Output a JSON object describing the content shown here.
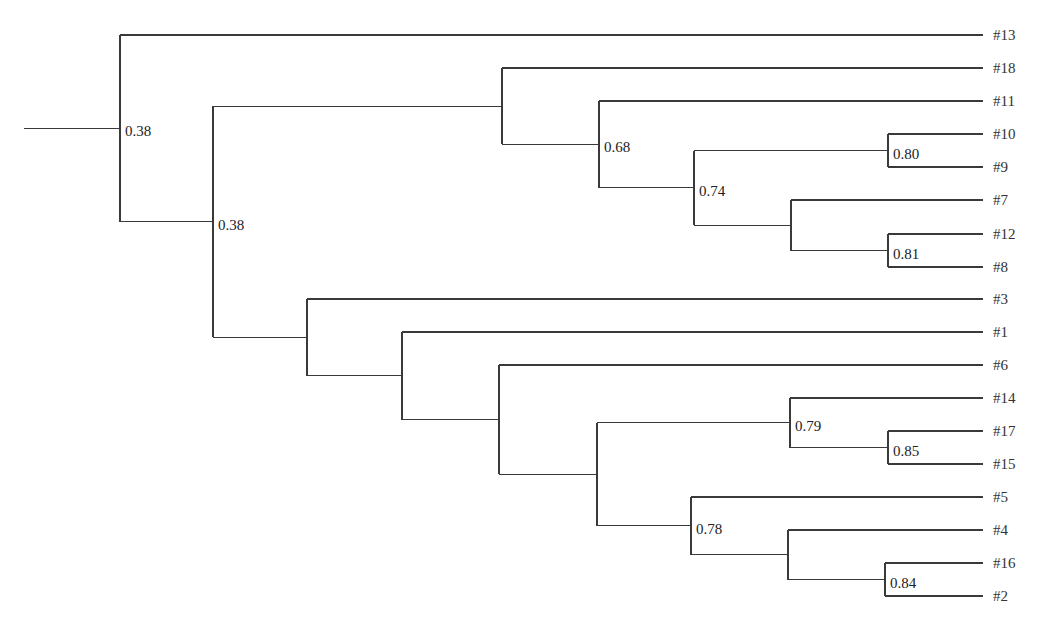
{
  "diagram": {
    "type": "dendrogram",
    "root_stem": {
      "x1": 24,
      "x2": 120
    },
    "leaf_end_x": 983,
    "leaf_label_x": 993,
    "leaves": [
      {
        "id": "l13",
        "label": "#13",
        "y": 35
      },
      {
        "id": "l18",
        "label": "#18",
        "y": 68
      },
      {
        "id": "l11",
        "label": "#11",
        "y": 101
      },
      {
        "id": "l10",
        "label": "#10",
        "y": 134
      },
      {
        "id": "l9",
        "label": "#9",
        "y": 167
      },
      {
        "id": "l7",
        "label": "#7",
        "y": 200
      },
      {
        "id": "l12",
        "label": "#12",
        "y": 234
      },
      {
        "id": "l8",
        "label": "#8",
        "y": 267
      },
      {
        "id": "l3",
        "label": "#3",
        "y": 299
      },
      {
        "id": "l1",
        "label": "#1",
        "y": 332
      },
      {
        "id": "l6",
        "label": "#6",
        "y": 365
      },
      {
        "id": "l14",
        "label": "#14",
        "y": 398
      },
      {
        "id": "l17",
        "label": "#17",
        "y": 431
      },
      {
        "id": "l15",
        "label": "#15",
        "y": 464
      },
      {
        "id": "l5",
        "label": "#5",
        "y": 497
      },
      {
        "id": "l4",
        "label": "#4",
        "y": 530
      },
      {
        "id": "l16",
        "label": "#16",
        "y": 563
      },
      {
        "id": "l2",
        "label": "#2",
        "y": 596
      }
    ],
    "nodes": [
      {
        "id": "n_root",
        "x": 120,
        "children": [
          "l13",
          "n_a"
        ],
        "label": "0.38"
      },
      {
        "id": "n_a",
        "x": 213,
        "children": [
          "n_b",
          "n_g"
        ],
        "label": "0.38"
      },
      {
        "id": "n_b",
        "x": 502,
        "children": [
          "l18",
          "n_c"
        ],
        "label": ""
      },
      {
        "id": "n_c",
        "x": 599,
        "children": [
          "l11",
          "n_d"
        ],
        "label": "0.68"
      },
      {
        "id": "n_d",
        "x": 694,
        "children": [
          "n_e",
          "n_f"
        ],
        "label": "0.74"
      },
      {
        "id": "n_e",
        "x": 888,
        "children": [
          "l10",
          "l9"
        ],
        "label": "0.80"
      },
      {
        "id": "n_f",
        "x": 791,
        "children": [
          "l7",
          "n_f2"
        ],
        "label": ""
      },
      {
        "id": "n_f2",
        "x": 888,
        "children": [
          "l12",
          "l8"
        ],
        "label": "0.81"
      },
      {
        "id": "n_g",
        "x": 307,
        "children": [
          "l3",
          "n_h"
        ],
        "label": ""
      },
      {
        "id": "n_h",
        "x": 402,
        "children": [
          "l1",
          "n_i"
        ],
        "label": ""
      },
      {
        "id": "n_i",
        "x": 499,
        "children": [
          "l6",
          "n_j"
        ],
        "label": ""
      },
      {
        "id": "n_j",
        "x": 597,
        "children": [
          "n_k",
          "n_m"
        ],
        "label": ""
      },
      {
        "id": "n_k",
        "x": 790,
        "children": [
          "l14",
          "n_l"
        ],
        "label": "0.79"
      },
      {
        "id": "n_l",
        "x": 888,
        "children": [
          "l17",
          "l15"
        ],
        "label": "0.85"
      },
      {
        "id": "n_m",
        "x": 691,
        "children": [
          "l5",
          "n_n"
        ],
        "label": "0.78"
      },
      {
        "id": "n_n",
        "x": 788,
        "children": [
          "l4",
          "n_o"
        ],
        "label": ""
      },
      {
        "id": "n_o",
        "x": 885,
        "children": [
          "l16",
          "l2"
        ],
        "label": "0.84"
      }
    ],
    "colors": {
      "line": "#3a3a3a",
      "text": "#333333",
      "background": "#ffffff"
    }
  }
}
